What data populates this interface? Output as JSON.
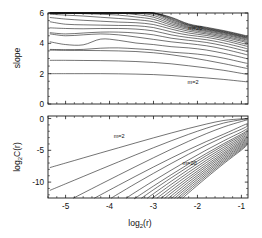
{
  "figure": {
    "title": "",
    "background_color": "#ffffff",
    "line_color": "#000000",
    "axis_color": "#1a1a1a"
  },
  "panels": {
    "top": {
      "name": "slope-panel",
      "ylabel": "slope",
      "yticks": [
        0,
        2,
        4,
        6
      ],
      "ytick_labels": [
        "0",
        "2",
        "4",
        "6"
      ],
      "ylim": [
        0,
        6
      ],
      "xlim": [
        -5.4,
        -0.85
      ],
      "xticks": [
        -5,
        -4,
        -3,
        -2,
        -1
      ],
      "xtick_labels": [],
      "annotations": [
        {
          "text": "m=20",
          "x": -2.05,
          "y": 4.85
        },
        {
          "text": "m=2",
          "x": -2.1,
          "y": 1.35
        }
      ]
    },
    "bottom": {
      "name": "correlation-panel",
      "ylabel": "log",
      "ylabel_sub": "2",
      "ylabel_rest": "C(r)",
      "yticks": [
        0,
        -5,
        -10
      ],
      "ytick_labels": [
        "0",
        "-5",
        "-10"
      ],
      "ylim": [
        -12.5,
        0.4
      ],
      "xlim": [
        -5.4,
        -0.85
      ],
      "xticks": [
        -5,
        -4,
        -3,
        -2,
        -1
      ],
      "xtick_labels": [
        "-5",
        "-4",
        "-3",
        "-2",
        "-1"
      ],
      "xlabel": "log",
      "xlabel_sub": "2",
      "xlabel_rest": "(r)",
      "annotations": [
        {
          "text": "m=2",
          "x": -3.78,
          "y": -3.1
        },
        {
          "text": "m=20",
          "x": -2.18,
          "y": -7.3
        }
      ]
    }
  },
  "chart_data": {
    "type": "line",
    "title": "",
    "xlabel": "log2(r)",
    "series_parameter": "m",
    "m_values": [
      2,
      3,
      4,
      5,
      6,
      7,
      8,
      9,
      10,
      11,
      12,
      13,
      14,
      15,
      16,
      17,
      18,
      19,
      20
    ],
    "panel_top": {
      "ylabel": "slope",
      "ylim": [
        0,
        6
      ],
      "xlim": [
        -5.4,
        -0.85
      ],
      "xticks": [
        -5,
        -4,
        -3,
        -2,
        -1
      ],
      "yticks": [
        0,
        2,
        4,
        6
      ],
      "grid": false,
      "x": [
        -5.35,
        -5.0,
        -4.6,
        -4.2,
        -3.8,
        -3.4,
        -3.0,
        -2.6,
        -2.2,
        -1.8,
        -1.4,
        -1.0,
        -0.87
      ],
      "series": [
        {
          "name": "m=2",
          "values": [
            2.0,
            2.0,
            2.0,
            2.0,
            1.99,
            1.97,
            1.94,
            1.88,
            1.8,
            1.72,
            1.62,
            1.5,
            1.46
          ]
        },
        {
          "name": "m=3",
          "values": [
            2.88,
            2.88,
            2.87,
            2.86,
            2.84,
            2.8,
            2.74,
            2.65,
            2.52,
            2.38,
            2.22,
            2.02,
            1.96
          ]
        },
        {
          "name": "m=4",
          "values": [
            3.55,
            3.54,
            3.53,
            3.52,
            3.5,
            3.46,
            3.38,
            3.25,
            3.08,
            2.88,
            2.66,
            2.42,
            2.34
          ]
        },
        {
          "name": "m=5",
          "values": [
            3.6,
            3.58,
            3.6,
            3.68,
            3.7,
            3.64,
            3.56,
            3.42,
            3.34,
            3.22,
            3.02,
            2.76,
            2.68
          ]
        },
        {
          "name": "m=6",
          "values": [
            4.1,
            3.92,
            3.9,
            4.28,
            4.2,
            4.02,
            3.92,
            3.78,
            3.7,
            3.56,
            3.34,
            3.08,
            2.98
          ]
        },
        {
          "name": "m=7",
          "values": [
            4.62,
            4.5,
            4.56,
            4.62,
            4.56,
            4.42,
            4.26,
            4.1,
            3.98,
            3.84,
            3.62,
            3.34,
            3.24
          ]
        },
        {
          "name": "m=8",
          "values": [
            4.7,
            4.62,
            4.68,
            4.74,
            4.74,
            4.68,
            4.56,
            4.34,
            4.2,
            4.06,
            3.84,
            3.56,
            3.46
          ]
        },
        {
          "name": "m=9",
          "values": [
            5.02,
            4.98,
            4.96,
            4.98,
            4.98,
            4.94,
            4.82,
            4.56,
            4.38,
            4.24,
            4.02,
            3.74,
            3.64
          ]
        },
        {
          "name": "m=10",
          "values": [
            5.42,
            5.26,
            5.22,
            5.2,
            5.18,
            5.16,
            5.04,
            4.76,
            4.54,
            4.4,
            4.18,
            3.9,
            3.8
          ]
        },
        {
          "name": "m=11",
          "values": [
            5.7,
            5.6,
            5.52,
            5.46,
            5.4,
            5.36,
            5.24,
            4.94,
            4.68,
            4.52,
            4.3,
            4.02,
            3.92
          ]
        },
        {
          "name": "m=12",
          "values": [
            5.92,
            5.86,
            5.8,
            5.72,
            5.64,
            5.56,
            5.42,
            5.08,
            4.8,
            4.62,
            4.4,
            4.14,
            4.04
          ]
        },
        {
          "name": "m=13",
          "values": [
            6.0,
            6.0,
            5.96,
            5.92,
            5.86,
            5.74,
            5.58,
            5.2,
            4.9,
            4.7,
            4.48,
            4.22,
            4.12
          ]
        },
        {
          "name": "m=14",
          "values": [
            6.0,
            6.0,
            6.0,
            6.0,
            6.0,
            5.9,
            5.72,
            5.3,
            4.98,
            4.78,
            4.56,
            4.3,
            4.2
          ]
        },
        {
          "name": "m=15",
          "values": [
            6.0,
            6.0,
            6.0,
            6.0,
            6.0,
            6.0,
            5.84,
            5.4,
            5.04,
            4.84,
            4.62,
            4.36,
            4.26
          ]
        },
        {
          "name": "m=16",
          "values": [
            6.0,
            6.0,
            6.0,
            6.0,
            6.0,
            6.0,
            5.94,
            5.48,
            5.1,
            4.9,
            4.68,
            4.42,
            4.32
          ]
        },
        {
          "name": "m=17",
          "values": [
            6.0,
            6.0,
            6.0,
            6.0,
            6.0,
            6.0,
            6.0,
            5.56,
            5.16,
            4.94,
            4.72,
            4.46,
            4.36
          ]
        },
        {
          "name": "m=18",
          "values": [
            6.0,
            6.0,
            6.0,
            6.0,
            6.0,
            6.0,
            6.0,
            5.62,
            5.2,
            4.98,
            4.76,
            4.5,
            4.4
          ]
        },
        {
          "name": "m=19",
          "values": [
            6.0,
            6.0,
            6.0,
            6.0,
            6.0,
            6.0,
            6.0,
            5.68,
            5.24,
            5.02,
            4.8,
            4.54,
            4.44
          ]
        },
        {
          "name": "m=20",
          "values": [
            6.0,
            6.0,
            6.0,
            6.0,
            6.0,
            6.0,
            6.0,
            5.72,
            5.28,
            5.06,
            4.84,
            4.58,
            4.48
          ]
        }
      ],
      "annotations": [
        {
          "text": "m=20",
          "x": -2.05,
          "y": 4.85
        },
        {
          "text": "m=2",
          "x": -2.1,
          "y": 1.35
        }
      ]
    },
    "panel_bottom": {
      "ylabel": "log2 C(r)",
      "ylim": [
        -12.5,
        0.4
      ],
      "xlim": [
        -5.4,
        -0.85
      ],
      "xticks": [
        -5,
        -4,
        -3,
        -2,
        -1
      ],
      "yticks": [
        0,
        -5,
        -10
      ],
      "grid": false,
      "x": [
        -5.35,
        -5.0,
        -4.6,
        -4.2,
        -3.8,
        -3.4,
        -3.0,
        -2.6,
        -2.2,
        -1.8,
        -1.4,
        -1.0,
        -0.87
      ],
      "series": [
        {
          "name": "m=2",
          "values": [
            -7.7,
            -7.0,
            -6.2,
            -5.4,
            -4.61,
            -3.82,
            -3.04,
            -2.28,
            -1.55,
            -0.87,
            -0.3,
            -0.05,
            -0.02
          ]
        },
        {
          "name": "m=3",
          "values": [
            -11.28,
            -10.27,
            -9.12,
            -7.97,
            -6.83,
            -5.7,
            -4.59,
            -3.51,
            -2.48,
            -1.53,
            -0.7,
            -0.18,
            -0.08
          ]
        },
        {
          "name": "m=4",
          "values": [
            -14.4,
            -13.15,
            -11.73,
            -10.32,
            -8.92,
            -7.53,
            -6.17,
            -4.84,
            -3.57,
            -2.38,
            -1.32,
            -0.46,
            -0.22
          ]
        },
        {
          "name": "m=5",
          "values": [
            -16.2,
            -14.9,
            -13.45,
            -11.99,
            -10.51,
            -9.05,
            -7.62,
            -6.23,
            -4.89,
            -3.62,
            -2.45,
            -1.2,
            -0.8
          ]
        },
        {
          "name": "m=6",
          "values": [
            -18.1,
            -16.7,
            -15.16,
            -13.53,
            -11.84,
            -10.2,
            -8.62,
            -7.08,
            -5.6,
            -4.19,
            -2.88,
            -1.68,
            -1.22
          ]
        },
        {
          "name": "m=7",
          "values": [
            -20.4,
            -18.8,
            -17.0,
            -15.17,
            -13.33,
            -11.53,
            -9.8,
            -8.13,
            -6.51,
            -4.96,
            -3.5,
            -2.12,
            -1.6
          ]
        },
        {
          "name": "m=8",
          "values": [
            -21.6,
            -19.95,
            -18.1,
            -16.22,
            -14.32,
            -12.45,
            -10.62,
            -8.85,
            -7.14,
            -5.5,
            -3.94,
            -2.46,
            -1.9
          ]
        },
        {
          "name": "m=9",
          "values": [
            -22.8,
            -21.05,
            -19.08,
            -17.1,
            -15.11,
            -13.14,
            -11.2,
            -9.34,
            -7.55,
            -5.84,
            -4.21,
            -2.68,
            -2.1
          ]
        },
        {
          "name": "m=10",
          "values": [
            -24.0,
            -22.15,
            -20.06,
            -17.97,
            -15.89,
            -13.83,
            -11.82,
            -9.88,
            -8.0,
            -6.22,
            -4.52,
            -2.92,
            -2.32
          ]
        },
        {
          "name": "m=11",
          "values": [
            -25.1,
            -23.15,
            -20.96,
            -18.78,
            -16.61,
            -14.47,
            -12.39,
            -10.38,
            -8.44,
            -6.59,
            -4.82,
            -3.16,
            -2.54
          ]
        },
        {
          "name": "m=12",
          "values": [
            -26.2,
            -24.15,
            -21.86,
            -19.58,
            -17.31,
            -15.09,
            -12.93,
            -10.85,
            -8.85,
            -6.94,
            -5.11,
            -3.39,
            -2.75
          ]
        },
        {
          "name": "m=13",
          "values": [
            -27.2,
            -25.1,
            -22.72,
            -20.35,
            -18.0,
            -15.7,
            -13.47,
            -11.31,
            -9.25,
            -7.28,
            -5.39,
            -3.61,
            -2.95
          ]
        },
        {
          "name": "m=14",
          "values": [
            -28.2,
            -26.05,
            -23.58,
            -21.11,
            -18.67,
            -16.28,
            -13.97,
            -11.74,
            -9.61,
            -7.58,
            -5.64,
            -3.81,
            -3.13
          ]
        },
        {
          "name": "m=15",
          "values": [
            -29.1,
            -26.9,
            -24.36,
            -21.82,
            -19.31,
            -16.85,
            -14.47,
            -12.18,
            -9.98,
            -7.89,
            -5.89,
            -4.01,
            -3.31
          ]
        },
        {
          "name": "m=16",
          "values": [
            -30.0,
            -27.75,
            -25.14,
            -22.53,
            -19.94,
            -17.41,
            -14.96,
            -12.6,
            -10.34,
            -8.19,
            -6.14,
            -4.21,
            -3.49
          ]
        },
        {
          "name": "m=17",
          "values": [
            -30.8,
            -28.5,
            -25.84,
            -23.17,
            -20.53,
            -17.93,
            -15.42,
            -13.0,
            -10.68,
            -8.48,
            -6.38,
            -4.4,
            -3.66
          ]
        },
        {
          "name": "m=18",
          "values": [
            -31.6,
            -29.25,
            -26.54,
            -23.81,
            -21.11,
            -18.46,
            -15.88,
            -13.4,
            -11.02,
            -8.77,
            -6.62,
            -4.59,
            -3.83
          ]
        },
        {
          "name": "m=19",
          "values": [
            -32.35,
            -29.95,
            -27.19,
            -24.41,
            -21.66,
            -18.95,
            -16.32,
            -13.78,
            -11.35,
            -9.05,
            -6.85,
            -4.78,
            -4.0
          ]
        },
        {
          "name": "m=20",
          "values": [
            -33.1,
            -30.65,
            -27.84,
            -25.01,
            -22.21,
            -19.45,
            -16.76,
            -14.17,
            -11.68,
            -9.33,
            -7.08,
            -4.96,
            -4.17
          ]
        }
      ],
      "annotations": [
        {
          "text": "m=2",
          "x": -3.78,
          "y": -3.1
        },
        {
          "text": "m=20",
          "x": -2.18,
          "y": -7.3
        }
      ]
    }
  }
}
